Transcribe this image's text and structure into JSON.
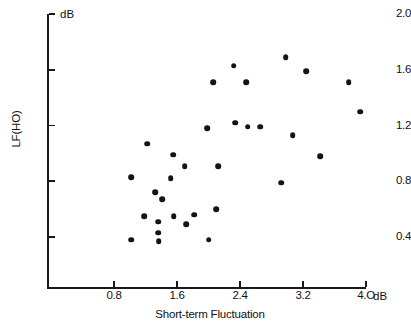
{
  "chart_data": {
    "type": "scatter",
    "title": "",
    "xlabel": "Short-term Fluctuation",
    "ylabel": "LF(HO)",
    "x_unit": "dB",
    "y_unit": "dB",
    "xlim": [
      0.0,
      4.0
    ],
    "ylim": [
      0.0,
      2.0
    ],
    "xticks": [
      0.8,
      1.6,
      2.4,
      3.2,
      4.0
    ],
    "xticklabels": [
      "0.8",
      "1.6",
      "2.4",
      "3.2",
      "4.O"
    ],
    "yticks": [
      0.4,
      0.8,
      1.2,
      1.6,
      2.0
    ],
    "yticklabels": [
      "0.4",
      "0.8",
      "1.2",
      "1.6",
      "2.0"
    ],
    "grid": false,
    "legend": null,
    "marker": "filled-circle",
    "marker_color": "#141414",
    "points": [
      {
        "x": 1.02,
        "y": 0.38
      },
      {
        "x": 1.02,
        "y": 0.83
      },
      {
        "x": 1.18,
        "y": 0.55
      },
      {
        "x": 1.22,
        "y": 1.07
      },
      {
        "x": 1.32,
        "y": 0.72
      },
      {
        "x": 1.36,
        "y": 0.51
      },
      {
        "x": 1.36,
        "y": 0.43
      },
      {
        "x": 1.37,
        "y": 0.37
      },
      {
        "x": 1.41,
        "y": 0.67
      },
      {
        "x": 1.52,
        "y": 0.82
      },
      {
        "x": 1.55,
        "y": 0.99
      },
      {
        "x": 1.56,
        "y": 0.55
      },
      {
        "x": 1.7,
        "y": 0.91
      },
      {
        "x": 1.72,
        "y": 0.49
      },
      {
        "x": 1.82,
        "y": 0.56
      },
      {
        "x": 1.98,
        "y": 1.18
      },
      {
        "x": 2.0,
        "y": 0.38
      },
      {
        "x": 2.06,
        "y": 1.51
      },
      {
        "x": 2.1,
        "y": 0.6
      },
      {
        "x": 2.12,
        "y": 0.91
      },
      {
        "x": 2.32,
        "y": 1.63
      },
      {
        "x": 2.34,
        "y": 1.22
      },
      {
        "x": 2.48,
        "y": 1.51
      },
      {
        "x": 2.5,
        "y": 1.19
      },
      {
        "x": 2.66,
        "y": 1.19
      },
      {
        "x": 2.92,
        "y": 0.79
      },
      {
        "x": 2.98,
        "y": 1.69
      },
      {
        "x": 3.07,
        "y": 1.13
      },
      {
        "x": 3.24,
        "y": 1.59
      },
      {
        "x": 3.42,
        "y": 0.98
      },
      {
        "x": 3.78,
        "y": 1.51
      },
      {
        "x": 3.93,
        "y": 1.3
      }
    ]
  }
}
